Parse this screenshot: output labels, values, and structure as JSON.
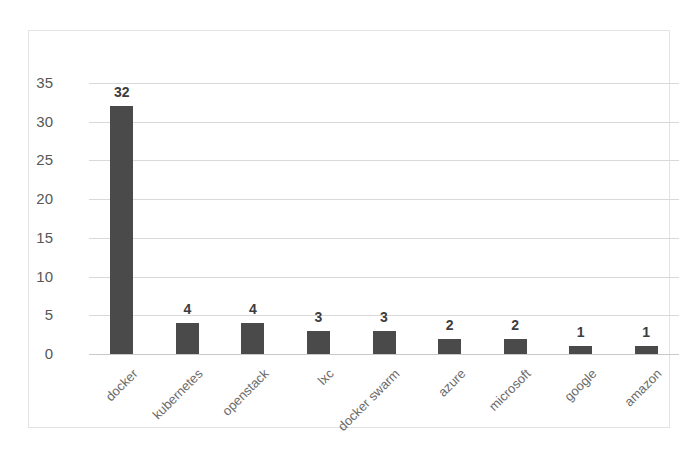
{
  "chart_data": {
    "type": "bar",
    "title": "",
    "xlabel": "",
    "ylabel": "",
    "ylim": [
      0,
      35
    ],
    "grid": true,
    "legend": "none",
    "orientation": "vertical",
    "bar_color": "#4a4a4a",
    "categories": [
      "docker",
      "kubernetes",
      "openstack",
      "lxc",
      "docker swarm",
      "azure",
      "microsoft",
      "google",
      "amazon"
    ],
    "values": [
      32,
      4,
      4,
      3,
      3,
      2,
      2,
      1,
      1
    ],
    "data_labels": [
      "32",
      "4",
      "4",
      "3",
      "3",
      "2",
      "2",
      "1",
      "1"
    ],
    "yticks": [
      0,
      5,
      10,
      15,
      20,
      25,
      30,
      35
    ],
    "ytick_labels": [
      "0",
      "5",
      "10",
      "15",
      "20",
      "25",
      "30",
      "35"
    ]
  },
  "colors": {
    "bar": "#4a4a4a",
    "gridline": "#d9d9d9",
    "border": "#e3e3e3",
    "tick_text": "#575757",
    "category_text": "#6b6b6b",
    "value_text": "#3d3d3d",
    "background": "#ffffff"
  }
}
